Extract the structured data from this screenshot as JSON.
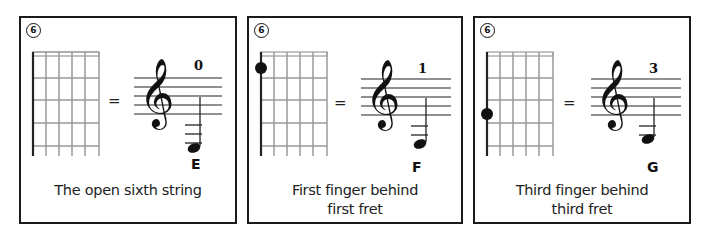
{
  "panels": [
    {
      "string_number": "6",
      "fret_number": "0",
      "note": "E",
      "caption_line1": "The open sixth string",
      "caption_line2": "",
      "finger_fret": 0,
      "ledger_lines": 3
    },
    {
      "string_number": "6",
      "fret_number": "1",
      "note": "F",
      "caption_line1": "First finger behind",
      "caption_line2": "first fret",
      "finger_fret": 1,
      "ledger_lines": 2
    },
    {
      "string_number": "6",
      "fret_number": "3",
      "note": "G",
      "caption_line1": "Third finger behind",
      "caption_line2": "third fret",
      "finger_fret": 3,
      "ledger_lines": 2
    }
  ],
  "symbols": {
    "equals": "=",
    "treble_clef": "𝄞"
  },
  "colors": {
    "border": "#1a1a1a",
    "fret": "#9a9a9a",
    "ink": "#111111"
  }
}
